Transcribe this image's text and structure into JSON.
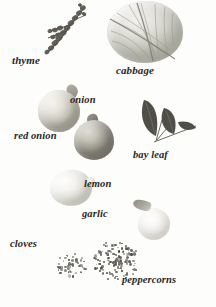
{
  "plate": {
    "title": "Ingredients specimen plate",
    "background_color": "#fdfdfc",
    "label_color": "#2a2724",
    "style": "grayscale photographic specimens with handwritten-style italic serif labels"
  },
  "labels": {
    "thyme": "thyme",
    "cabbage": "cabbage",
    "onion": "onion",
    "red_onion": "red onion",
    "bay_leaf": "bay leaf",
    "lemon": "lemon",
    "garlic": "garlic",
    "cloves": "cloves",
    "peppercorns": "peppercorns"
  },
  "specimens": [
    {
      "name": "thyme",
      "shape": "sprig",
      "tone": "#6f6d64"
    },
    {
      "name": "cabbage",
      "shape": "round-head",
      "tone": "#ddddd5"
    },
    {
      "name": "onion",
      "shape": "bulb",
      "tone": "#e0ded5"
    },
    {
      "name": "red onion",
      "shape": "bulb",
      "tone": "#b9b6ab"
    },
    {
      "name": "bay leaf",
      "shape": "leaf-sprig",
      "tone": "#55554e"
    },
    {
      "name": "lemon",
      "shape": "oval",
      "tone": "#f2f1ed"
    },
    {
      "name": "garlic",
      "shape": "bulb-with-stalk",
      "tone": "#f3f2ee"
    },
    {
      "name": "cloves",
      "shape": "scatter-pile",
      "tone": "#565349"
    },
    {
      "name": "peppercorns",
      "shape": "scatter-pile",
      "tone": "#4e4c44"
    }
  ]
}
